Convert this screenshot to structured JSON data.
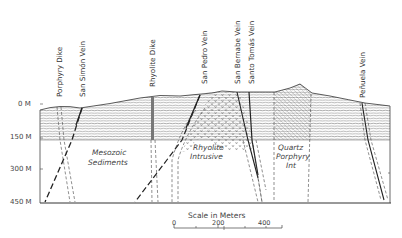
{
  "figure": {
    "type": "geologic-cross-section",
    "colors": {
      "ink": "#333333",
      "background": "#ffffff"
    },
    "depth_axis": {
      "labels": [
        "0 M",
        "150 M",
        "300 M",
        "450 M"
      ]
    },
    "structures": [
      {
        "id": "porphyry-dike",
        "label": "Porphyry Dike"
      },
      {
        "id": "san-simon-vein",
        "label": "San Simón Vein"
      },
      {
        "id": "rhyolite-dike",
        "label": "Rhyolite Dike"
      },
      {
        "id": "san-pedro-vein",
        "label": "San Pedro Vein"
      },
      {
        "id": "san-bernabe-vein",
        "label": "San Bernabe Vein"
      },
      {
        "id": "santo-tomas-vein",
        "label": "Santo Tomás Vein"
      },
      {
        "id": "penuela-vein",
        "label": "Peñuela Vein"
      }
    ],
    "units": {
      "mesozoic": [
        "Mesozoic",
        "Sediments"
      ],
      "rhyolite": [
        "Rhyolite",
        "Intrusive"
      ],
      "quartz": [
        "Quartz",
        "Porphyry",
        "Int"
      ]
    },
    "scale": {
      "title": "Scale in Meters",
      "ticks": [
        "0",
        "200",
        "400"
      ]
    }
  }
}
